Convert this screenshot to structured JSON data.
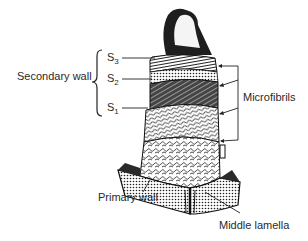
{
  "figure": {
    "labels": {
      "secondary_wall": "Secondary wall",
      "s3": {
        "main": "S",
        "sub": "3"
      },
      "s2": {
        "main": "S",
        "sub": "2"
      },
      "s1": {
        "main": "S",
        "sub": "1"
      },
      "microfibrils": "Microfibrils",
      "primary_wall": "Primary wall",
      "middle_lamella": "Middle lamella"
    },
    "colors": {
      "ink": "#1a1a1a",
      "background": "#ffffff"
    }
  }
}
